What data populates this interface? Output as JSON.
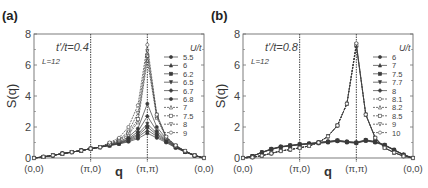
{
  "chart_data": [
    {
      "panel_label": "(a)",
      "type": "line",
      "title": "",
      "annotation": "t'/t=0.4",
      "size_label": "L=12",
      "xlabel": "q",
      "ylabel": "S(q)",
      "ylim": [
        0,
        8
      ],
      "yticks": [
        0,
        2,
        4,
        6,
        8
      ],
      "xtick_labels": [
        "(0,0)",
        "(π,0)",
        "(π,π)",
        "(0,0)"
      ],
      "x_points": 19,
      "vertical_lines_at": [
        "(π,0)",
        "(π,π)"
      ],
      "grid": false,
      "legend_title": "U/t",
      "legend_position": "right",
      "series": [
        {
          "name": "5.5",
          "marker": "filled-circle",
          "line": "solid",
          "values": [
            0,
            0.07,
            0.17,
            0.28,
            0.38,
            0.48,
            0.6,
            0.7,
            0.8,
            0.9,
            1.05,
            1.25,
            1.6,
            1.3,
            1.0,
            0.65,
            0.38,
            0.15,
            0
          ]
        },
        {
          "name": "6",
          "marker": "filled-triangle",
          "line": "solid",
          "values": [
            0,
            0.07,
            0.17,
            0.28,
            0.38,
            0.48,
            0.6,
            0.7,
            0.8,
            0.92,
            1.1,
            1.35,
            1.8,
            1.4,
            1.05,
            0.68,
            0.4,
            0.16,
            0
          ]
        },
        {
          "name": "6.2",
          "marker": "filled-square",
          "line": "solid",
          "values": [
            0,
            0.07,
            0.17,
            0.28,
            0.38,
            0.48,
            0.6,
            0.7,
            0.82,
            0.95,
            1.15,
            1.45,
            2.0,
            1.5,
            1.1,
            0.7,
            0.4,
            0.16,
            0
          ]
        },
        {
          "name": "6.5",
          "marker": "filled-down-triangle",
          "line": "solid",
          "values": [
            0,
            0.07,
            0.17,
            0.28,
            0.38,
            0.48,
            0.6,
            0.7,
            0.83,
            0.97,
            1.2,
            1.55,
            2.2,
            1.6,
            1.15,
            0.72,
            0.41,
            0.16,
            0
          ]
        },
        {
          "name": "6.7",
          "marker": "filled-diamond",
          "line": "solid",
          "values": [
            0,
            0.07,
            0.17,
            0.28,
            0.38,
            0.48,
            0.6,
            0.7,
            0.85,
            1.0,
            1.25,
            1.7,
            2.7,
            1.75,
            1.2,
            0.74,
            0.42,
            0.17,
            0
          ]
        },
        {
          "name": "6.8",
          "marker": "filled-circle",
          "line": "solid",
          "values": [
            0,
            0.07,
            0.17,
            0.28,
            0.38,
            0.48,
            0.6,
            0.7,
            0.87,
            1.05,
            1.35,
            1.9,
            3.5,
            2.0,
            1.25,
            0.76,
            0.43,
            0.17,
            0
          ]
        },
        {
          "name": "7",
          "marker": "open-triangle",
          "line": "dashed",
          "values": [
            0,
            0.07,
            0.17,
            0.28,
            0.38,
            0.48,
            0.6,
            0.7,
            0.9,
            1.1,
            1.5,
            2.3,
            6.3,
            2.6,
            1.3,
            0.78,
            0.44,
            0.17,
            0
          ]
        },
        {
          "name": "7.5",
          "marker": "open-square",
          "line": "dashed",
          "values": [
            0,
            0.07,
            0.17,
            0.28,
            0.38,
            0.48,
            0.6,
            0.7,
            0.92,
            1.15,
            1.6,
            2.5,
            6.6,
            2.7,
            1.32,
            0.79,
            0.44,
            0.17,
            0
          ]
        },
        {
          "name": "8",
          "marker": "open-down-triangle",
          "line": "dashed",
          "values": [
            0,
            0.07,
            0.17,
            0.28,
            0.38,
            0.48,
            0.6,
            0.7,
            0.95,
            1.2,
            1.7,
            2.9,
            6.9,
            2.8,
            1.35,
            0.8,
            0.45,
            0.17,
            0
          ]
        },
        {
          "name": "9",
          "marker": "open-circle",
          "line": "dashed",
          "values": [
            0,
            0.07,
            0.17,
            0.28,
            0.38,
            0.48,
            0.6,
            0.7,
            1.0,
            1.3,
            2.0,
            3.4,
            7.3,
            2.8,
            1.38,
            0.82,
            0.46,
            0.17,
            0
          ]
        }
      ]
    },
    {
      "panel_label": "(b)",
      "type": "line",
      "title": "",
      "annotation": "t'/t=0.8",
      "size_label": "L=12",
      "xlabel": "q",
      "ylabel": "S(q)",
      "ylim": [
        0,
        8
      ],
      "yticks": [
        0,
        2,
        4,
        6,
        8
      ],
      "xtick_labels": [
        "(0,0)",
        "(π,0)",
        "(π,π)",
        "(0,0)"
      ],
      "x_points": 19,
      "vertical_lines_at": [
        "(π,0)",
        "(π,π)"
      ],
      "grid": false,
      "legend_title": "U/t",
      "legend_position": "right",
      "series": [
        {
          "name": "6",
          "marker": "filled-circle",
          "line": "solid",
          "values": [
            0,
            0.12,
            0.35,
            0.55,
            0.7,
            0.78,
            0.85,
            0.9,
            0.95,
            1.0,
            1.08,
            1.0,
            0.95,
            1.1,
            1.0,
            0.8,
            0.5,
            0.2,
            0
          ]
        },
        {
          "name": "7",
          "marker": "filled-triangle",
          "line": "solid",
          "values": [
            0,
            0.12,
            0.35,
            0.56,
            0.71,
            0.79,
            0.86,
            0.91,
            0.96,
            1.02,
            1.1,
            1.02,
            0.97,
            1.12,
            1.02,
            0.82,
            0.51,
            0.2,
            0
          ]
        },
        {
          "name": "7.5",
          "marker": "filled-square",
          "line": "solid",
          "values": [
            0,
            0.12,
            0.36,
            0.57,
            0.72,
            0.8,
            0.87,
            0.92,
            0.98,
            1.04,
            1.12,
            1.04,
            0.98,
            1.14,
            1.04,
            0.83,
            0.52,
            0.21,
            0
          ]
        },
        {
          "name": "7.7",
          "marker": "filled-down-triangle",
          "line": "solid",
          "values": [
            0,
            0.12,
            0.36,
            0.58,
            0.73,
            0.81,
            0.88,
            0.93,
            1.0,
            1.06,
            1.13,
            1.05,
            1.0,
            1.15,
            1.05,
            0.84,
            0.53,
            0.21,
            0
          ]
        },
        {
          "name": "8",
          "marker": "filled-diamond",
          "line": "solid",
          "values": [
            0,
            0.12,
            0.37,
            0.59,
            0.74,
            0.82,
            0.9,
            0.95,
            1.02,
            1.08,
            1.15,
            1.07,
            1.02,
            1.17,
            1.07,
            0.85,
            0.54,
            0.22,
            0
          ]
        },
        {
          "name": "8.1",
          "marker": "open-circle",
          "line": "dashed",
          "values": [
            0,
            0.05,
            0.15,
            0.3,
            0.45,
            0.55,
            0.65,
            0.78,
            1.0,
            1.4,
            2.1,
            3.5,
            7.2,
            2.8,
            1.3,
            0.65,
            0.35,
            0.12,
            0
          ]
        },
        {
          "name": "8.2",
          "marker": "open-triangle",
          "line": "dashed",
          "values": [
            0,
            0.05,
            0.15,
            0.3,
            0.45,
            0.55,
            0.65,
            0.78,
            1.0,
            1.4,
            2.1,
            3.5,
            7.25,
            2.8,
            1.3,
            0.65,
            0.35,
            0.12,
            0
          ]
        },
        {
          "name": "8.5",
          "marker": "open-square",
          "line": "dashed",
          "values": [
            0,
            0.05,
            0.15,
            0.3,
            0.45,
            0.55,
            0.65,
            0.78,
            1.0,
            1.4,
            2.1,
            3.5,
            7.3,
            2.8,
            1.3,
            0.65,
            0.35,
            0.12,
            0
          ]
        },
        {
          "name": "9",
          "marker": "open-down-triangle",
          "line": "dashed",
          "values": [
            0,
            0.05,
            0.15,
            0.3,
            0.45,
            0.55,
            0.65,
            0.78,
            1.0,
            1.4,
            2.1,
            3.5,
            7.35,
            2.8,
            1.3,
            0.65,
            0.35,
            0.12,
            0
          ]
        },
        {
          "name": "10",
          "marker": "open-circle",
          "line": "dashed",
          "values": [
            0,
            0.05,
            0.15,
            0.3,
            0.45,
            0.55,
            0.65,
            0.78,
            1.0,
            1.4,
            2.1,
            3.5,
            7.4,
            2.8,
            1.3,
            0.65,
            0.35,
            0.12,
            0
          ]
        }
      ]
    }
  ],
  "colors": {
    "axis": "#6e6e6e",
    "line": "#3a3a3a",
    "text": "#444444",
    "background": "#ffffff"
  }
}
